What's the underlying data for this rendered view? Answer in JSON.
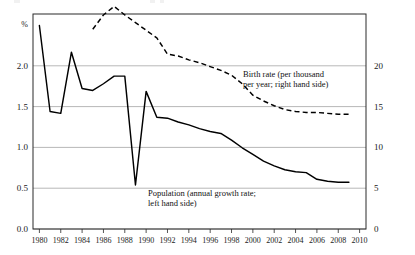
{
  "chart_data": {
    "type": "line",
    "title": "",
    "xlabel": "",
    "ylabel": "%",
    "ylim": [
      0.0,
      2.25
    ],
    "y2lim": [
      0,
      22.5
    ],
    "xlim": [
      1979.4,
      2010.6
    ],
    "grid": true,
    "legend_position": "inline-annotations",
    "left_axis": {
      "unit_label": "%",
      "ticks": [
        "0.0",
        "0.5",
        "1.0",
        "1.5",
        "2.0"
      ],
      "tick_values": [
        0.0,
        0.5,
        1.0,
        1.5,
        2.0
      ]
    },
    "right_axis": {
      "ticks": [
        "0",
        "5",
        "10",
        "15",
        "20"
      ],
      "tick_values": [
        0,
        5,
        10,
        15,
        20
      ]
    },
    "x_tick_labels": [
      "1980",
      "1982",
      "1984",
      "1986",
      "1988",
      "1990",
      "1992",
      "1994",
      "1996",
      "1998",
      "2000",
      "2002",
      "2004",
      "2006",
      "2008",
      "2010"
    ],
    "x_tick_values": [
      1980,
      1982,
      1984,
      1986,
      1988,
      1990,
      1992,
      1994,
      1996,
      1998,
      2000,
      2002,
      2004,
      2006,
      2008,
      2010
    ],
    "series": [
      {
        "name": "Population (annual growth rate; left hand side)",
        "short_name": "Population",
        "axis": "left",
        "style": "solid",
        "x": [
          1980,
          1981,
          1982,
          1983,
          1984,
          1985,
          1986,
          1987,
          1988,
          1989,
          1990,
          1991,
          1992,
          1993,
          1994,
          1995,
          1996,
          1997,
          1998,
          1999,
          2000,
          2001,
          2002,
          2003,
          2004,
          2005,
          2006,
          2007,
          2008,
          2009
        ],
        "values": [
          2.13,
          1.23,
          1.21,
          1.85,
          1.47,
          1.45,
          1.52,
          1.6,
          1.6,
          0.46,
          1.44,
          1.17,
          1.16,
          1.12,
          1.09,
          1.05,
          1.02,
          1.0,
          0.93,
          0.85,
          0.78,
          0.71,
          0.66,
          0.62,
          0.6,
          0.59,
          0.52,
          0.5,
          0.49,
          0.49
        ]
      },
      {
        "name": "Birth rate (per thousand per year; right hand side)",
        "short_name": "Birth rate",
        "axis": "right",
        "style": "dashed",
        "x": [
          1985,
          1986,
          1987,
          1988,
          1989,
          1990,
          1991,
          1992,
          1993,
          1994,
          1995,
          1996,
          1997,
          1998,
          1999,
          2000,
          2001,
          2002,
          2003,
          2004,
          2005,
          2006,
          2007,
          2008,
          2009
        ],
        "values": [
          20.9,
          22.4,
          23.3,
          22.4,
          21.6,
          20.8,
          20.0,
          18.3,
          18.1,
          17.7,
          17.4,
          17.0,
          16.6,
          16.1,
          15.2,
          14.0,
          13.4,
          12.9,
          12.5,
          12.3,
          12.2,
          12.2,
          12.1,
          12.0,
          12.0
        ]
      }
    ],
    "annotations": [
      {
        "id": "birth-rate-annotation",
        "line1": "Birth rate (per thousand",
        "line2": "per year; right hand side)"
      },
      {
        "id": "population-annotation",
        "line1": "Population (annual growth rate;",
        "line2": "left hand side)"
      }
    ]
  }
}
